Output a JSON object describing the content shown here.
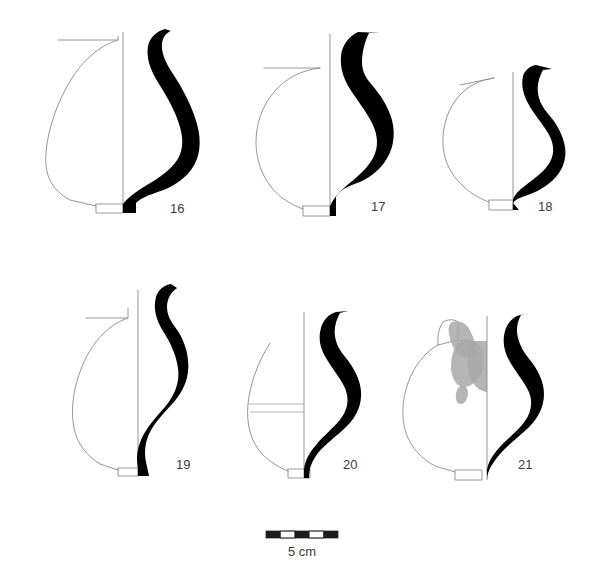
{
  "plate": {
    "title": "Ceramic vessel profile drawings",
    "background_color": "#ffffff",
    "ink_color": "#000000",
    "outline_color": "#8a8a8a",
    "label_color": "#3a3a3a",
    "damage_color": "#a8a8a8"
  },
  "figures": [
    {
      "id": "vessel-16",
      "label": "16",
      "label_x": 170,
      "label_y": 213,
      "row": 1,
      "column": 1,
      "has_damage_patches": false,
      "has_break_lines": false,
      "description": "Large ovoid jar with everted neck and small ring foot"
    },
    {
      "id": "vessel-17",
      "label": "17",
      "label_x": 378,
      "label_y": 211,
      "row": 1,
      "column": 2,
      "has_damage_patches": false,
      "has_break_lines": false,
      "description": "Jar with angular carinated shoulder and flaring rim"
    },
    {
      "id": "vessel-18",
      "label": "18",
      "label_x": 545,
      "label_y": 211,
      "row": 1,
      "column": 3,
      "has_damage_patches": false,
      "has_break_lines": false,
      "description": "Small globular jar with short neck and ring foot"
    },
    {
      "id": "vessel-19",
      "label": "19",
      "label_x": 183,
      "label_y": 469,
      "row": 2,
      "column": 1,
      "has_damage_patches": false,
      "has_break_lines": false,
      "description": "Ovoid jar with tall sinuous neck and narrow base"
    },
    {
      "id": "vessel-20",
      "label": "20",
      "label_x": 350,
      "label_y": 469,
      "row": 2,
      "column": 2,
      "has_damage_patches": false,
      "has_break_lines": true,
      "description": "Partially preserved jar with two horizontal break lines"
    },
    {
      "id": "vessel-21",
      "label": "21",
      "label_x": 525,
      "label_y": 469,
      "row": 2,
      "column": 3,
      "has_damage_patches": true,
      "has_break_lines": false,
      "description": "Jar with grey surface damage patches on the shoulder"
    }
  ],
  "scale": {
    "label": "5 cm",
    "label_x": 302,
    "label_y": 556,
    "bar_x": 266,
    "bar_y": 531,
    "bar_width": 72,
    "bar_height": 7,
    "segments": 5,
    "segment_colors": [
      "dark",
      "light",
      "dark",
      "light",
      "dark"
    ]
  }
}
